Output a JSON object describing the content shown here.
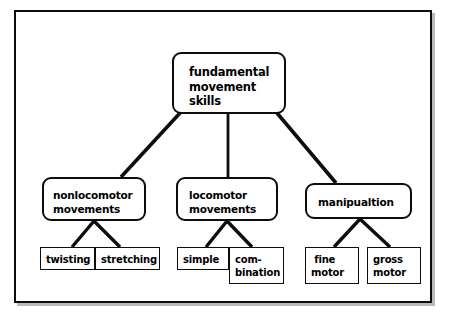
{
  "diagram": {
    "type": "hierarchy-tree",
    "title_node": "fundamental\nmovement\nskills",
    "frame_color": "#0d0d0d",
    "background_color": "#ffffff",
    "nodes": {
      "root": {
        "label": "fundamental\nmovement\nskills",
        "shape": "rounded-rectangle"
      },
      "nonlocomotor": {
        "label": "nonlocomotor\nmovements",
        "shape": "rounded-rectangle"
      },
      "locomotor": {
        "label": "locomotor\nmovements",
        "shape": "rounded-rectangle"
      },
      "manipulation": {
        "label": "manipualtion",
        "shape": "rounded-rectangle"
      },
      "twisting": {
        "label": "twisting",
        "shape": "rectangle"
      },
      "stretching": {
        "label": "stretching",
        "shape": "rectangle"
      },
      "simple": {
        "label": "simple",
        "shape": "rectangle"
      },
      "combination": {
        "label": "com-\nbination",
        "shape": "rectangle"
      },
      "fine_motor": {
        "label": " fine\nmotor",
        "shape": "rectangle"
      },
      "gross_motor": {
        "label": "gross\nmotor",
        "shape": "rectangle"
      }
    },
    "edges": [
      {
        "from": "root",
        "to": "nonlocomotor"
      },
      {
        "from": "root",
        "to": "locomotor"
      },
      {
        "from": "root",
        "to": "manipulation"
      },
      {
        "from": "nonlocomotor",
        "to": "twisting"
      },
      {
        "from": "nonlocomotor",
        "to": "stretching"
      },
      {
        "from": "locomotor",
        "to": "simple"
      },
      {
        "from": "locomotor",
        "to": "combination"
      },
      {
        "from": "manipulation",
        "to": "fine_motor"
      },
      {
        "from": "manipulation",
        "to": "gross_motor"
      }
    ]
  }
}
